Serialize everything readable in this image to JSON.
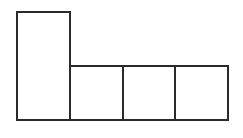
{
  "diagram": {
    "stroke_color": "#2a2a2a",
    "background": "#ffffff",
    "shapes": [
      {
        "name": "tall-rectangle",
        "x": 17,
        "y": 12,
        "w": 53,
        "h": 108
      },
      {
        "name": "square-1",
        "x": 70,
        "y": 66,
        "w": 53,
        "h": 54
      },
      {
        "name": "square-2",
        "x": 123,
        "y": 66,
        "w": 52,
        "h": 54
      },
      {
        "name": "square-3",
        "x": 175,
        "y": 66,
        "w": 53,
        "h": 54
      }
    ]
  }
}
